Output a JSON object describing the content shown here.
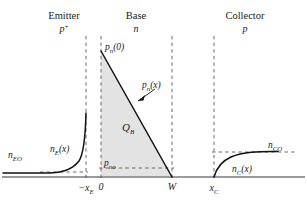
{
  "figure": {
    "title_regions": [
      {
        "name": "Emitter",
        "doping": "p",
        "doping_sup": "+",
        "center_x": 64
      },
      {
        "name": "Base",
        "doping": "n",
        "doping_sup": "",
        "center_x": 136
      },
      {
        "name": "Collector",
        "doping": "p",
        "doping_sup": "",
        "center_x": 245
      }
    ],
    "axis_ticks": [
      {
        "label": "−x",
        "sub": "E",
        "x": 86
      },
      {
        "label": "0",
        "sub": "",
        "x": 101
      },
      {
        "label": "W",
        "sub": "",
        "x": 172
      },
      {
        "label": "x",
        "sub": "C",
        "x": 214
      }
    ],
    "curve_labels": {
      "emitter_equilibrium": {
        "base": "n",
        "sub": "EO",
        "x": 8,
        "y": 155
      },
      "emitter_profile": {
        "base": "n",
        "sub": "E",
        "tail": "(x)",
        "x": 52,
        "y": 150
      },
      "base_edge_value": {
        "base": "p",
        "sub": "n",
        "tail": "(0)",
        "x": 106,
        "y": 48
      },
      "base_profile": {
        "base": "p",
        "sub": "n",
        "tail": "(x)",
        "x": 140,
        "y": 86
      },
      "base_equilibrium": {
        "base": "p",
        "sub": "no",
        "x": 102,
        "y": 165
      },
      "stored_charge": {
        "base": "Q",
        "sub": "B",
        "x": 128,
        "y": 130
      },
      "collector_profile": {
        "base": "n",
        "sub": "C",
        "tail": "(x)",
        "x": 236,
        "y": 170
      },
      "collector_equilibrium": {
        "base": "n",
        "sub": "CO",
        "x": 272,
        "y": 149
      }
    },
    "colors": {
      "axis": "#999999",
      "curve": "#111111",
      "dashed": "#555555",
      "shade": "#e2e2e2",
      "text": "#1a1a1a"
    },
    "geometry": {
      "baseline_y": 177,
      "x_emitter_junction": 86,
      "x_base_start": 101,
      "x_base_end": 172,
      "x_collector_junction": 214,
      "y_base_peak": 51,
      "y_p_no": 168,
      "y_n_CO": 152,
      "dash_top_y": 36
    },
    "chart_type": "minority-carrier-concentration-profile"
  }
}
